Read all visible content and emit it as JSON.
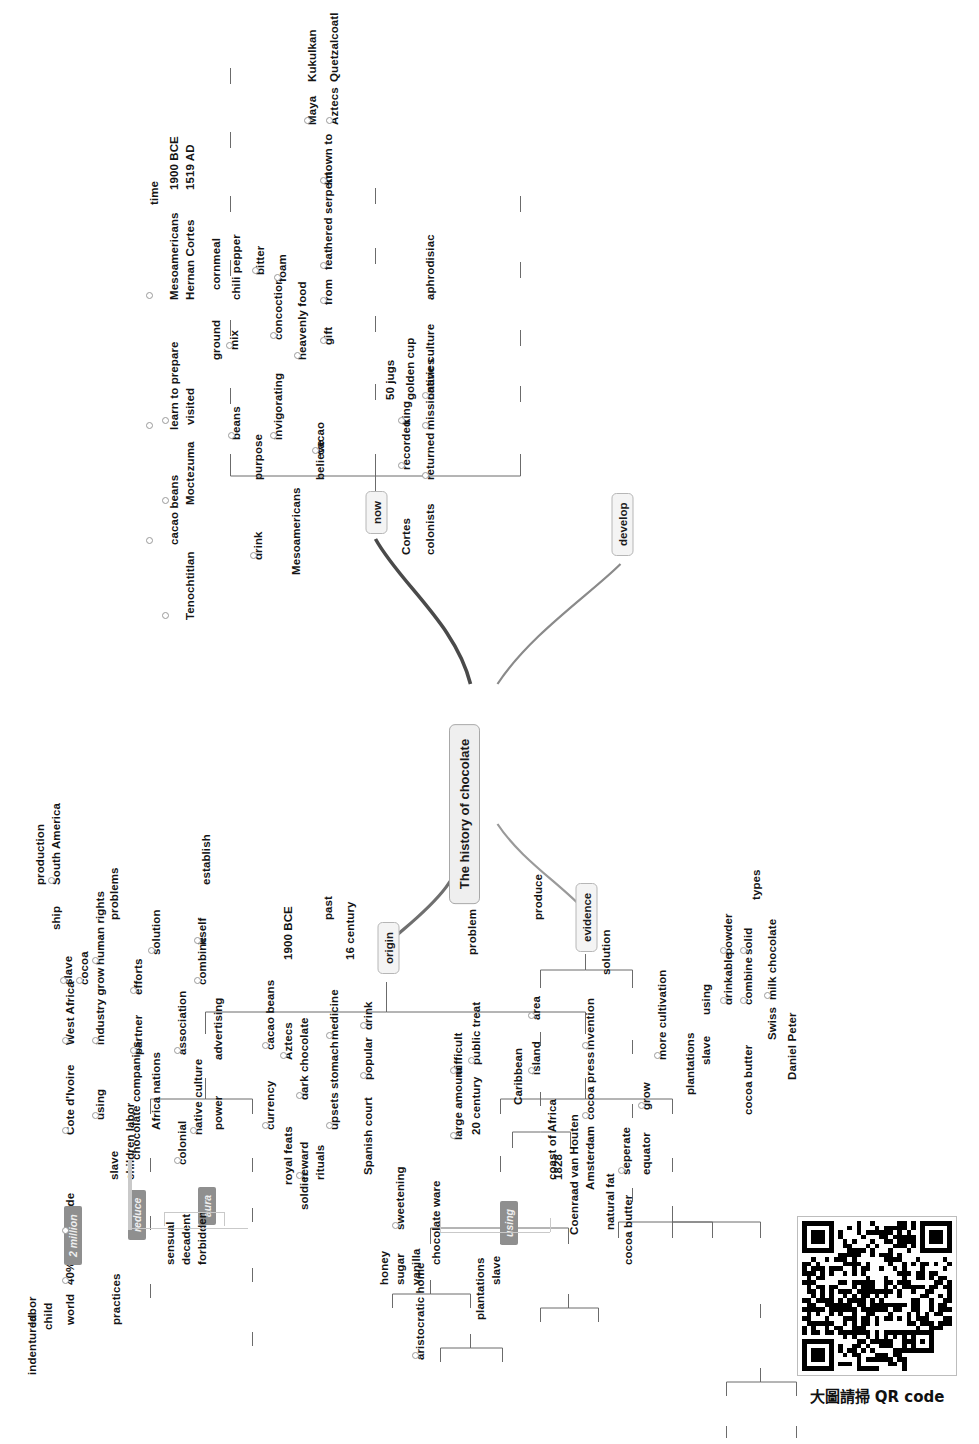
{
  "root": {
    "label": "The history of chocolate"
  },
  "branches": [
    {
      "key": "origin",
      "label": "origin"
    },
    {
      "key": "evidence",
      "label": "evidence"
    },
    {
      "key": "now",
      "label": "now"
    },
    {
      "key": "develop",
      "label": "develop"
    }
  ],
  "origin": {
    "children": [
      {
        "label": "time",
        "children": [
          {
            "label": "1900 BCE",
            "children": [
              {
                "label": "Mesoamericans"
              },
              {
                "label": "learn to prepare"
              },
              {
                "label": "cacao beans"
              }
            ]
          },
          {
            "label": "1519 AD",
            "icon": "note-icon",
            "children": [
              {
                "label": "Hernan Cortes"
              },
              {
                "label": "visited"
              },
              {
                "label": "Moctezuma"
              },
              {
                "label": "Tenochtitlan"
              }
            ]
          }
        ]
      },
      {
        "label": "Mesoamericans",
        "children": [
          {
            "label": "purpose",
            "children": [
              {
                "label": "drink",
                "children": [
                  {
                    "label": "beans",
                    "children": [
                      {
                        "label": "ground"
                      },
                      {
                        "label": "mix",
                        "children": [
                          {
                            "label": "cornmeal"
                          },
                          {
                            "label": "chili pepper"
                          }
                        ]
                      }
                    ]
                  },
                  {
                    "label": "invigorating"
                  },
                  {
                    "label": "concoction",
                    "children": [
                      {
                        "label": "bitter"
                      },
                      {
                        "label": "foam"
                      }
                    ]
                  }
                ]
              }
            ]
          },
          {
            "label": "believe",
            "children": [
              {
                "label": "cacao",
                "children": [
                  {
                    "label": "heavenly food"
                  },
                  {
                    "label": "gift"
                  },
                  {
                    "label": "from"
                  },
                  {
                    "label": "feathered serpent",
                    "children": [
                      {
                        "label": "known to",
                        "children": [
                          {
                            "label": "Maya"
                          },
                          {
                            "label": "Kukulkan"
                          },
                          {
                            "label": "Aztecs"
                          },
                          {
                            "label": "Quetzalcoatl"
                          }
                        ]
                      }
                    ]
                  }
                ]
              }
            ]
          }
        ]
      }
    ]
  },
  "evidence": {
    "children": [
      {
        "label": "Cortes",
        "children": [
          {
            "label": "recorded"
          },
          {
            "label": "king"
          },
          {
            "label": "50 jugs"
          },
          {
            "label": "golden cup"
          }
        ]
      },
      {
        "label": "colonists",
        "children": [
          {
            "label": "returned"
          },
          {
            "label": "missionaries"
          },
          {
            "label": "native culture"
          },
          {
            "label": "aphrodisiac"
          }
        ]
      }
    ]
  },
  "now": {
    "children": [
      {
        "label": "production",
        "children": [
          {
            "label": "South America"
          },
          {
            "label": "slave",
            "icon": "circle-icon"
          },
          {
            "label": "ship"
          },
          {
            "label": "Cote d'Ivoire"
          },
          {
            "label": "West Africa"
          },
          {
            "label": "cocoa",
            "icon": "circle-icon"
          },
          {
            "label": "provide"
          },
          {
            "label": "40%"
          },
          {
            "label": "world"
          },
          {
            "badge": "2 million"
          },
          {
            "label": "using"
          },
          {
            "label": "industry grow"
          },
          {
            "label": "human rights"
          },
          {
            "label": "slave"
          },
          {
            "label": "children labor"
          },
          {
            "label": "indentured"
          },
          {
            "label": "child"
          },
          {
            "label": "labor"
          },
          {
            "label": "practices"
          }
        ]
      },
      {
        "label": "problems",
        "children": [
          {
            "badge": "reduce"
          },
          {
            "label": "chocolate companies"
          },
          {
            "label": "Africa nations"
          },
          {
            "label": "partner"
          },
          {
            "label": "efforts"
          },
          {
            "label": "solution"
          }
        ]
      },
      {
        "label": "establish",
        "children": [
          {
            "badge": "aura"
          },
          {
            "label": "colonial"
          },
          {
            "label": "native culture"
          },
          {
            "label": "power"
          },
          {
            "label": "association"
          },
          {
            "label": "advertising"
          },
          {
            "label": "combine"
          },
          {
            "label": "itself"
          },
          {
            "label": "sensual"
          },
          {
            "label": "decadent"
          },
          {
            "label": "forbidden"
          }
        ]
      }
    ]
  },
  "develop": {
    "children": [
      {
        "label": "past",
        "children": [
          {
            "label": "Aztecs",
            "children": [
              {
                "label": "currency"
              },
              {
                "label": "cacao beans"
              },
              {
                "label": "royal feats"
              },
              {
                "label": "soldier"
              },
              {
                "label": "reward"
              },
              {
                "label": "rituals"
              },
              {
                "label": "dark chocolate"
              },
              {
                "label": "1900 BCE"
              }
            ]
          },
          {
            "label": "16 century",
            "children": [
              {
                "label": "upsets stomach"
              },
              {
                "label": "medicine"
              },
              {
                "label": "Spanish court"
              },
              {
                "label": "popular"
              },
              {
                "label": "drink"
              },
              {
                "label": "honey"
              },
              {
                "label": "sugar"
              },
              {
                "label": "vanilla"
              },
              {
                "label": "sweetening"
              },
              {
                "label": "aristocratic home"
              },
              {
                "label": "chocolate ware"
              }
            ]
          }
        ]
      },
      {
        "label": "produce",
        "children": [
          {
            "label": "problem",
            "children": [
              {
                "label": "large amount"
              },
              {
                "label": "difficult"
              },
              {
                "label": "20 century"
              },
              {
                "label": "public treat"
              },
              {
                "label": "Caribbean"
              },
              {
                "label": "island"
              },
              {
                "label": "area"
              },
              {
                "label": "coast of Africa"
              },
              {
                "badge": "using"
              },
              {
                "label": "plantations"
              },
              {
                "label": "slave"
              }
            ]
          },
          {
            "label": "solution",
            "children": [
              {
                "label": "1828"
              },
              {
                "label": "Coenraad van Houten"
              },
              {
                "label": "Amsterdam"
              },
              {
                "label": "cocoa press"
              },
              {
                "label": "invention"
              },
              {
                "label": "natural fat"
              },
              {
                "label": "cocoa butter"
              },
              {
                "label": "seperate"
              },
              {
                "label": "equator"
              },
              {
                "label": "grow"
              },
              {
                "label": "more cultivation"
              },
              {
                "label": "plantations"
              },
              {
                "label": "slave"
              },
              {
                "label": "using"
              }
            ]
          }
        ]
      },
      {
        "label": "types",
        "children": [
          {
            "label": "drinkable"
          },
          {
            "label": "powder"
          },
          {
            "label": "cocoa butter"
          },
          {
            "label": "combine"
          },
          {
            "label": "solid"
          },
          {
            "label": "Swiss"
          },
          {
            "label": "milk chocolate"
          },
          {
            "label": "Daniel Peter"
          }
        ]
      }
    ]
  },
  "qr": {
    "caption": "大圖請掃 QR code"
  }
}
